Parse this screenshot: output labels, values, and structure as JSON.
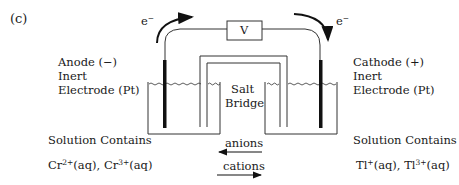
{
  "figure": {
    "panel_label": "(c)"
  },
  "circuit": {
    "voltmeter_label": "V",
    "electron_left": "e",
    "electron_right": "e",
    "electron_charge": "−"
  },
  "anode": {
    "line1": "Anode (−)",
    "line2": "Inert",
    "line3": "Electrode (Pt)"
  },
  "cathode": {
    "line1": "Cathode (+)",
    "line2": "Inert",
    "line3": "Electrode (Pt)"
  },
  "salt_bridge": {
    "line1": "Salt",
    "line2": "Bridge"
  },
  "ion_flow": {
    "anions": "anions",
    "cations": "cations"
  },
  "left_solution": {
    "heading": "Solution Contains",
    "ion1": "Cr",
    "ion1_charge": "2+",
    "ion1_state": "(aq), ",
    "ion2": "Cr",
    "ion2_charge": "3+",
    "ion2_state": "(aq)"
  },
  "right_solution": {
    "heading": "Solution Contains",
    "ion1": "Tl",
    "ion1_charge": "+",
    "ion1_state": "(aq), ",
    "ion2": "Tl",
    "ion2_charge": "3+",
    "ion2_state": "(aq)"
  },
  "colors": {
    "line": "#333333",
    "electrode": "#111111"
  }
}
